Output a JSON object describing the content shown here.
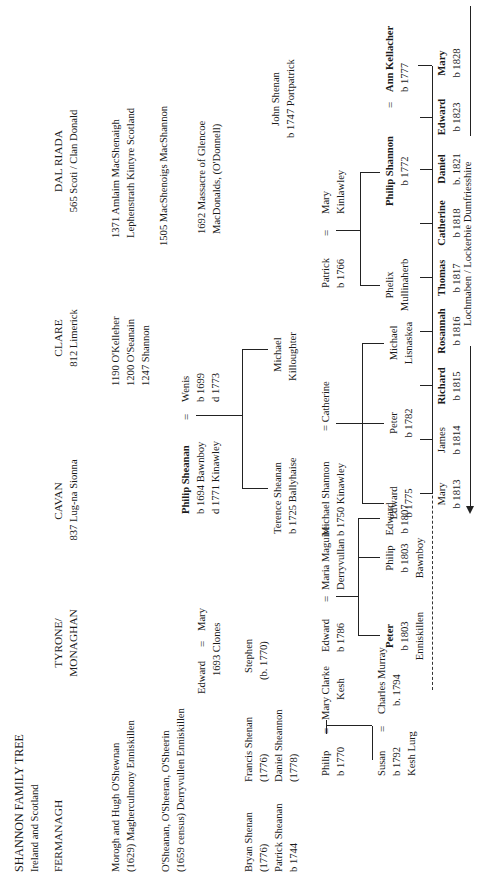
{
  "document": {
    "title": "SHANNON FAMILY TREE",
    "subtitle": "Ireland and Scotland"
  },
  "regions": {
    "fermanagh": "FERMANAGH",
    "tyrone_monaghan_line1": "TYRONE/",
    "tyrone_monaghan_line2": "MONAGHAN",
    "cavan": "CAVAN",
    "cavan_sub": "837 Lug-na Sionna",
    "clare": "CLARE",
    "clare_sub": "812 Limerick",
    "dalriada": "DAL RIADA",
    "dalriada_sub": "565 Scoti / Clan Donald"
  },
  "fermanagh_notes": [
    {
      "line1": "Morogh and Hugh O'Shewnan",
      "line2": "(1629)    Magherculmony Enniskillen"
    },
    {
      "line1": "O'Sheanan, O'Sheeran, O'Sheerin",
      "line2": "(1659 census)  Derryvullen Enniskillen"
    }
  ],
  "clare_notes": [
    "1190 O'Kelleher",
    "1200 O'Seanain",
    "1247 Shannon"
  ],
  "dalriada_notes": [
    {
      "line1": "1371 Amlaim MacShenaigh",
      "line2": "Lephenstrath Kintyre Scotland"
    },
    {
      "line1": "1505 MacShenoigs  MacShannon",
      "line2": ""
    },
    {
      "line1": "1692 Massacre of Glencoe",
      "line2": "MacDonalds, (O'Donnell)"
    }
  ],
  "tyrone_family": {
    "edward": "Edward",
    "eq": "=",
    "mary": "Mary",
    "year_place": "1693 Clones",
    "stephen_name": "Stephen",
    "stephen_year": "(b. 1770)"
  },
  "fermanagh_family": [
    {
      "name": "Bryan Shenan",
      "year": "(1776)"
    },
    {
      "name": "Patrick Sheanan",
      "year": "b 1744"
    },
    {
      "name": "Francis Shenan",
      "year": "(1776)"
    },
    {
      "name": "Daniel Sheannon",
      "year": "(1778)"
    }
  ],
  "philip_sheanan": {
    "name": "Philip Sheanan",
    "born": "b 1694 Bawnboy",
    "died": "d 1771 Kinawley",
    "eq": "=",
    "spouse_name": "Wenis",
    "spouse_born": "b 1699",
    "spouse_died": "d 1773"
  },
  "philip_children": [
    {
      "name": "Terence Sheanan",
      "detail": "b 1725 Ballyhaise"
    },
    {
      "name": "Michael",
      "detail": "Killoughter"
    }
  ],
  "michael_shannon": {
    "name": "Michael Shannon",
    "detail": "b 1750 Kinawley",
    "eq": "=",
    "spouse": "Catherine"
  },
  "michael_children": [
    {
      "name": "Edward",
      "detail": "b 1775"
    },
    {
      "name": "Peter",
      "detail": "b 1782"
    },
    {
      "name": "Michael",
      "detail": "Lisnaskea"
    }
  ],
  "patrick_mary": {
    "name": "Patrick",
    "detail": "b 1766",
    "eq": "=",
    "spouse_name": "Mary",
    "spouse_detail": "Kinlawley"
  },
  "phelix": {
    "name": "Phelix",
    "detail": "Mullinaherb"
  },
  "philip_shannon": {
    "name": "Philip Shannon",
    "detail": "b 1772",
    "eq": "=",
    "spouse_name": "Ann Kellacher",
    "spouse_detail": "b 1777"
  },
  "john_shenan": {
    "name": "John Shenan",
    "detail": "b 1747 Portpatrick"
  },
  "edward_maria": {
    "name": "Edward",
    "detail": "b 1786",
    "eq": "=",
    "spouse_name": "Maria Maguire",
    "spouse_detail": "Derryvullan"
  },
  "edward_children": [
    {
      "name": "Peter",
      "detail": "b 1803",
      "place": "Enniskillen",
      "bold": true
    },
    {
      "name": "Philip",
      "detail": "b 1803",
      "place": "Bawnboy",
      "bold": false
    },
    {
      "name": "Edward",
      "detail": "b 1807",
      "place": "",
      "bold": false
    }
  ],
  "philip_shannon_children": [
    {
      "name": "Mary",
      "detail": "b 1813",
      "bold": false
    },
    {
      "name": "James",
      "detail": "b 1814",
      "bold": false
    },
    {
      "name": "Richard",
      "detail": "b 1815",
      "bold": true
    },
    {
      "name": "Rosannah",
      "detail": "b 1816",
      "bold": true
    },
    {
      "name": "Thomas",
      "detail": "b 1817",
      "bold": true
    },
    {
      "name": "Catherine",
      "detail": "b 1818",
      "bold": true
    },
    {
      "name": "Daniel",
      "detail": "b. 1821",
      "bold": true
    },
    {
      "name": "Edward",
      "detail": "b 1823",
      "bold": true
    },
    {
      "name": "Mary",
      "detail": "b 1828",
      "bold": true
    }
  ],
  "scotland_label": "Lochmaben / Lockerbie Dumfriesshire",
  "philip_mary_clarke": {
    "name": "Philip",
    "detail": "b 1770",
    "eq": "=",
    "spouse_name": "Mary Clarke",
    "spouse_detail": "Kesh"
  },
  "susan_charles": {
    "name": "Susan",
    "detail": "b 1792",
    "place": "Kesh Lurg",
    "eq": "=",
    "spouse_name": "Charles Murray",
    "spouse_detail": "b. 1794"
  }
}
